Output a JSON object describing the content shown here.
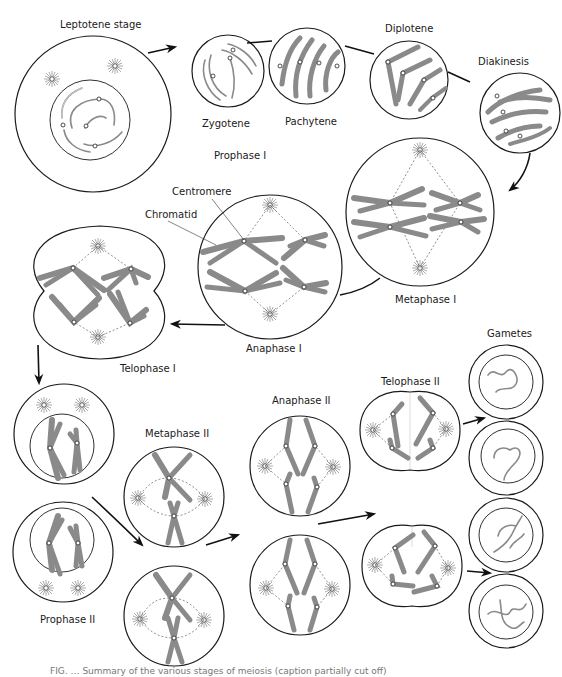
{
  "figure": {
    "title": "Stages of meiosis",
    "caption_partial": "FIG. …  Summary of the various stages of meiosis (caption partially cut off)"
  },
  "labels": {
    "leptotene": "Leptotene stage",
    "zygotene": "Zygotene",
    "pachytene": "Pachytene",
    "diplotene": "Diplotene",
    "diakinesis": "Diakinesis",
    "prophase1": "Prophase I",
    "centromere": "Centromere",
    "chromatid": "Chromatid",
    "metaphase1": "Metaphase I",
    "anaphase1": "Anaphase I",
    "telophase1": "Telophase I",
    "prophase2": "Prophase II",
    "metaphase2": "Metaphase II",
    "anaphase2": "Anaphase II",
    "telophase2": "Telophase II",
    "gametes": "Gametes"
  },
  "colors": {
    "outline": "#1a1a1a",
    "chromosome": "#8a8a8a",
    "background": "#ffffff"
  }
}
